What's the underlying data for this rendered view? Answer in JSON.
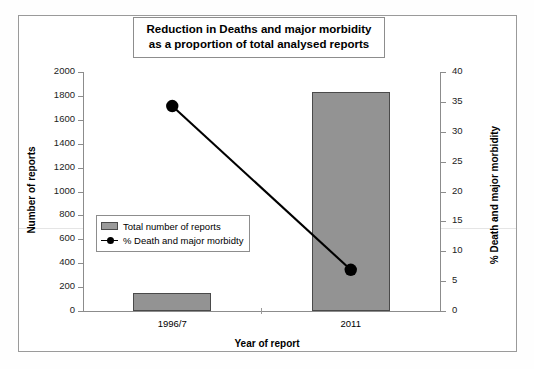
{
  "chart_data": {
    "type": "bar",
    "title": "Reduction in Deaths and major morbidity as a proportion of total analysed reports",
    "title_line1": "Reduction in Deaths and major morbidity",
    "title_line2": "as a proportion of total analysed reports",
    "xlabel": "Year of report",
    "ylabel": "Number of reports",
    "ylabel_secondary": "% Death and major morbidity",
    "categories": [
      "1996/7",
      "2011"
    ],
    "ylim": [
      0,
      2000
    ],
    "ylim_secondary": [
      0,
      40
    ],
    "yticks": [
      0,
      200,
      400,
      600,
      800,
      1000,
      1200,
      1400,
      1600,
      1800,
      2000
    ],
    "yticks_secondary": [
      0,
      5,
      10,
      15,
      20,
      25,
      30,
      35,
      40
    ],
    "grid": false,
    "legend_position": "center-left-inside",
    "series": [
      {
        "name": "Total number of reports",
        "type": "bar",
        "axis": "left",
        "values": [
          150,
          1833
        ],
        "color": "#939393",
        "edge_color": "#4a4a4a"
      },
      {
        "name": "% Death and major morbidty",
        "type": "line",
        "axis": "right",
        "values": [
          34.3,
          6.9
        ],
        "color": "#000000",
        "marker": "filled-circle"
      }
    ]
  },
  "legend": {
    "items": [
      {
        "label": "Total number of reports",
        "marker": "bar-swatch"
      },
      {
        "label": "% Death and major morbidty",
        "marker": "line-dot"
      }
    ]
  },
  "axis_tick_labels": {
    "left": [
      "2000",
      "1800",
      "1600",
      "1400",
      "1200",
      "1000",
      "800",
      "600",
      "400",
      "200",
      "0"
    ],
    "right": [
      "40",
      "35",
      "30",
      "25",
      "20",
      "15",
      "10",
      "5",
      "0"
    ]
  },
  "colors": {
    "bar_fill": "#939393",
    "bar_edge": "#4a4a4a",
    "line": "#000000",
    "axis": "#8c8c8c",
    "frame": "#9a9a9a",
    "background": "#ffffff"
  }
}
